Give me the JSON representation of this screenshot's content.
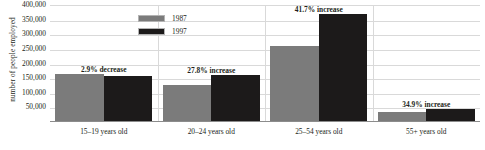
{
  "chart_data": {
    "type": "bar",
    "title": "",
    "xlabel": "",
    "ylabel": "number of people employed",
    "ylim": [
      0,
      400000
    ],
    "grid": true,
    "legend_position": "top-left-inside",
    "categories": [
      "15–19 years old",
      "20–24 years old",
      "25–54 years old",
      "55+ years old"
    ],
    "series": [
      {
        "name": "1987",
        "color": "#7b7b7b",
        "values": [
          160000,
          123000,
          258000,
          30000
        ]
      },
      {
        "name": "1997",
        "color": "#1c1a1a",
        "values": [
          155000,
          157000,
          366000,
          40000
        ]
      }
    ],
    "annotations": [
      "2.9% decrease",
      "27.8% increase",
      "41.7% increase",
      "34.9% increase"
    ],
    "yticks": [
      "400,000",
      "350,000",
      "300,000",
      "250,000",
      "200,000",
      "150,000",
      "100,000",
      "50,000"
    ],
    "ytick_values": [
      400000,
      350000,
      300000,
      250000,
      200000,
      150000,
      100000,
      50000
    ]
  }
}
